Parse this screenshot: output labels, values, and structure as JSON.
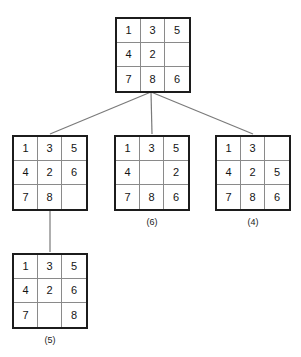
{
  "diagram": {
    "blank_tile": "",
    "colors": {
      "grid_border": "#1c1c1c",
      "cell_divider": "#8a8a8a",
      "edge": "#7a7a7a",
      "text": "#141414",
      "background": "#ffffff"
    },
    "nodes": [
      {
        "id": "root",
        "name": "root-state",
        "label": "",
        "tiles": [
          "1",
          "3",
          "5",
          "4",
          "2",
          "",
          "7",
          "8",
          "6"
        ],
        "blank_index": 5
      },
      {
        "id": "child-left",
        "name": "child-state-left",
        "label": "",
        "tiles": [
          "1",
          "3",
          "5",
          "4",
          "2",
          "6",
          "7",
          "8",
          ""
        ],
        "blank_index": 8
      },
      {
        "id": "child-middle",
        "name": "child-state-middle",
        "label": "(6)",
        "tiles": [
          "1",
          "3",
          "5",
          "4",
          "",
          "2",
          "7",
          "8",
          "6"
        ],
        "blank_index": 4
      },
      {
        "id": "child-right",
        "name": "child-state-right",
        "label": "(4)",
        "tiles": [
          "1",
          "3",
          "",
          "4",
          "2",
          "5",
          "7",
          "8",
          "6"
        ],
        "blank_index": 2
      },
      {
        "id": "grandchild",
        "name": "grandchild-state",
        "label": "(5)",
        "tiles": [
          "1",
          "3",
          "5",
          "4",
          "2",
          "6",
          "7",
          "",
          "8"
        ],
        "blank_index": 7
      }
    ]
  }
}
